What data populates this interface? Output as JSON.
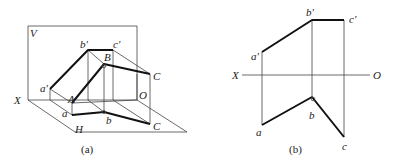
{
  "figure_a": {
    "caption": "(a)",
    "labels": {
      "V": "V",
      "X": "X",
      "H": "H",
      "O": "O",
      "a_prime": "a'",
      "b_prime": "b'",
      "c_prime": "c'",
      "A": "A",
      "B": "B",
      "C_upper": "C",
      "a": "a",
      "b": "b",
      "C_lower": "C"
    }
  },
  "figure_b": {
    "caption": "(b)",
    "labels": {
      "X": "X",
      "O": "O",
      "a_prime": "a'",
      "b_prime": "b'",
      "c_prime": "c'",
      "a": "a",
      "b": "b",
      "c": "c"
    }
  },
  "colors": {
    "line": "#111111",
    "thin": "#444444",
    "background": "#ffffff"
  }
}
